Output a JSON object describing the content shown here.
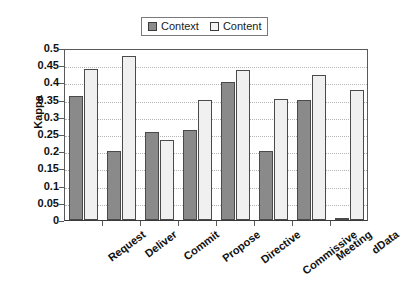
{
  "chart_data": {
    "type": "bar",
    "title": "",
    "xlabel": "",
    "ylabel": "Kappa",
    "ylim": [
      0,
      0.5
    ],
    "ytick_step": 0.05,
    "yticks": [
      "0.5",
      "0.45",
      "0.4",
      "0.35",
      "0.3",
      "0.25",
      "0.2",
      "0.15",
      "0.1",
      "0.05",
      "0"
    ],
    "grid": "horizontal-dotted",
    "legend_position": "top-center",
    "categories": [
      "Request",
      "Deliver",
      "Commit",
      "Propose",
      "Directive",
      "Commissive",
      "Meeting",
      "dData"
    ],
    "series": [
      {
        "name": "Context",
        "color": "#8a8a8a",
        "values": [
          0.361,
          0.2,
          0.255,
          0.261,
          0.4,
          0.2,
          0.349,
          0.006
        ]
      },
      {
        "name": "Content",
        "color": "#f0f0f0",
        "values": [
          0.44,
          0.476,
          0.232,
          0.348,
          0.437,
          0.352,
          0.422,
          0.379
        ]
      }
    ]
  },
  "legend": {
    "items": [
      {
        "label": "Context"
      },
      {
        "label": "Content"
      }
    ]
  }
}
